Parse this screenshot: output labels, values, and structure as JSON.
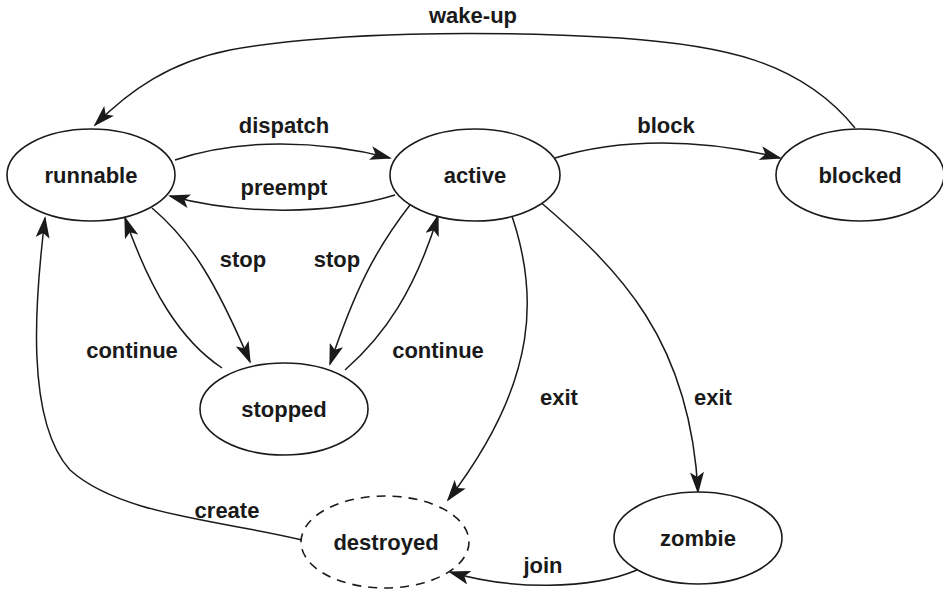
{
  "diagram": {
    "type": "state-transition",
    "states": [
      {
        "id": "runnable",
        "label": "runnable"
      },
      {
        "id": "active",
        "label": "active"
      },
      {
        "id": "blocked",
        "label": "blocked"
      },
      {
        "id": "stopped",
        "label": "stopped"
      },
      {
        "id": "destroyed",
        "label": "destroyed",
        "style": "dashed"
      },
      {
        "id": "zombie",
        "label": "zombie"
      }
    ],
    "transitions": [
      {
        "from": "runnable",
        "to": "active",
        "label": "dispatch"
      },
      {
        "from": "active",
        "to": "runnable",
        "label": "preempt"
      },
      {
        "from": "active",
        "to": "blocked",
        "label": "block"
      },
      {
        "from": "blocked",
        "to": "runnable",
        "label": "wake-up"
      },
      {
        "from": "runnable",
        "to": "stopped",
        "label": "stop"
      },
      {
        "from": "stopped",
        "to": "runnable",
        "label": "continue"
      },
      {
        "from": "active",
        "to": "stopped",
        "label": "stop"
      },
      {
        "from": "stopped",
        "to": "active",
        "label": "continue"
      },
      {
        "from": "active",
        "to": "destroyed",
        "label": "exit"
      },
      {
        "from": "active",
        "to": "zombie",
        "label": "exit"
      },
      {
        "from": "zombie",
        "to": "destroyed",
        "label": "join"
      },
      {
        "from": "destroyed",
        "to": "runnable",
        "label": "create"
      }
    ]
  }
}
